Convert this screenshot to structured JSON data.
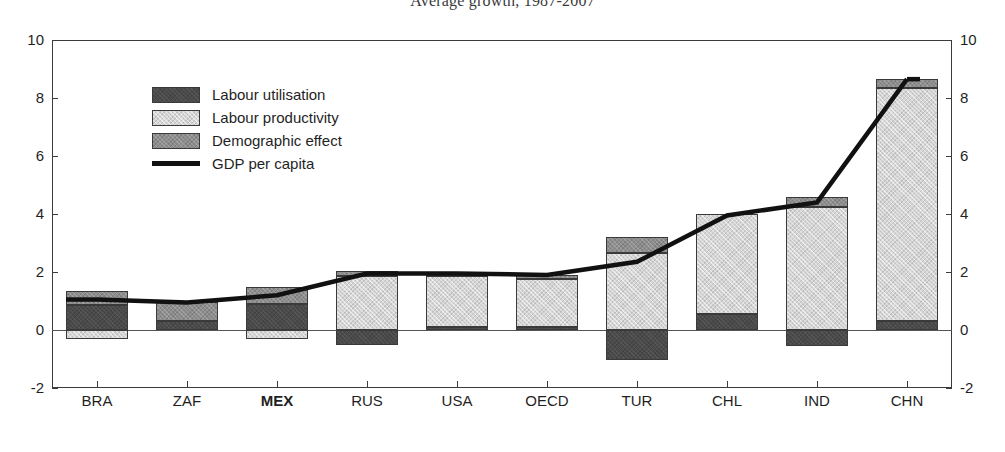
{
  "chart_data": {
    "type": "bar",
    "title": "Average growth, 1987-2007",
    "xlabel": "",
    "ylabel": "",
    "ylim": [
      -2,
      10
    ],
    "yticks": [
      -2,
      0,
      2,
      4,
      6,
      8,
      10
    ],
    "ytick_labels": [
      "-2",
      "0",
      "2",
      "4",
      "6",
      "8",
      "10"
    ],
    "grid": false,
    "stacked": true,
    "dual_axis": true,
    "legend_position": "top-left inside plot",
    "categories": [
      "BRA",
      "ZAF",
      "MEX",
      "RUS",
      "USA",
      "OECD",
      "TUR",
      "CHL",
      "IND",
      "CHN"
    ],
    "highlighted_category": "MEX",
    "series": [
      {
        "name": "Labour utilisation",
        "color": "#4a4a4a",
        "values": [
          0.85,
          0.3,
          0.9,
          -0.5,
          0.1,
          0.1,
          -1.05,
          0.55,
          -0.55,
          0.3
        ]
      },
      {
        "name": "Labour productivity",
        "color": "#d5d5d5",
        "values": [
          -0.3,
          0.0,
          -0.3,
          1.85,
          1.75,
          1.65,
          2.65,
          3.45,
          4.25,
          8.05
        ]
      },
      {
        "name": "Demographic effect",
        "color": "#8d8d8d",
        "values": [
          0.5,
          0.65,
          0.6,
          0.2,
          0.15,
          0.15,
          0.55,
          0.0,
          0.35,
          0.3
        ]
      }
    ],
    "line_series": {
      "name": "GDP per capita",
      "color": "#111111",
      "values": [
        1.05,
        0.95,
        1.2,
        1.95,
        1.95,
        1.9,
        2.35,
        3.95,
        4.4,
        8.65
      ]
    }
  },
  "legend": {
    "items": [
      {
        "label": "Labour utilisation",
        "type": "swatch",
        "swatch_class": "seg-util"
      },
      {
        "label": "Labour productivity",
        "type": "swatch",
        "swatch_class": "seg-prod"
      },
      {
        "label": "Demographic effect",
        "type": "swatch",
        "swatch_class": "seg-demo"
      },
      {
        "label": "GDP per capita",
        "type": "line",
        "swatch_class": "legend-line"
      }
    ]
  }
}
